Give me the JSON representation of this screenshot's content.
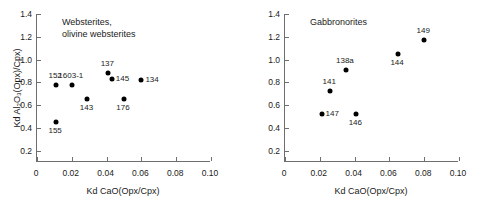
{
  "figure": {
    "axis_color": "#6e6e6e",
    "marker_color": "#000000",
    "background": "#ffffff"
  },
  "chart_data": [
    {
      "type": "scatter",
      "title": "Websterites,\nolivine websterites",
      "xlabel": "Kd CaO(Opx/Cpx)",
      "ylabel": "Kd Al₂O₃(Opx)/Cpx)",
      "xlim": [
        0,
        0.1
      ],
      "ylim": [
        0.1,
        1.4
      ],
      "grid": false,
      "legend": "none",
      "xticks": [
        0,
        0.02,
        0.04,
        0.06,
        0.08,
        0.1
      ],
      "xticklabels": [
        "0",
        "0.02",
        "0.04",
        "0.06",
        "0.08",
        "0.10"
      ],
      "yticks": [
        0.2,
        0.4,
        0.6,
        0.8,
        1.0,
        1.2,
        1.4
      ],
      "yticklabels": [
        "0.2",
        "0.4",
        "0.6",
        "0.8",
        "1.0",
        "1.2",
        "1.4"
      ],
      "points": [
        {
          "label": "152",
          "x": 0.011,
          "y": 0.78,
          "label_pos": "above"
        },
        {
          "label": "1603-1",
          "x": 0.02,
          "y": 0.78,
          "label_pos": "above"
        },
        {
          "label": "155",
          "x": 0.011,
          "y": 0.45,
          "label_pos": "below"
        },
        {
          "label": "143",
          "x": 0.029,
          "y": 0.65,
          "label_pos": "below"
        },
        {
          "label": "137",
          "x": 0.041,
          "y": 0.88,
          "label_pos": "above"
        },
        {
          "label": "145",
          "x": 0.043,
          "y": 0.83,
          "label_pos": "right"
        },
        {
          "label": "176",
          "x": 0.05,
          "y": 0.65,
          "label_pos": "below"
        },
        {
          "label": "134",
          "x": 0.06,
          "y": 0.82,
          "label_pos": "right"
        }
      ]
    },
    {
      "type": "scatter",
      "title": "Gabbronorites",
      "xlabel": "Kd CaO(Opx/Cpx)",
      "ylabel": "",
      "xlim": [
        0,
        0.1
      ],
      "ylim": [
        0.1,
        1.4
      ],
      "grid": false,
      "legend": "none",
      "xticks": [
        0,
        0.02,
        0.04,
        0.06,
        0.08,
        0.1
      ],
      "xticklabels": [
        "0",
        "0.02",
        "0.04",
        "0.06",
        "0.08",
        "0.10"
      ],
      "yticks": [
        0.2,
        0.4,
        0.6,
        0.8,
        1.0,
        1.2,
        1.4
      ],
      "yticklabels": [
        "0.2",
        "0.4",
        "0.6",
        "0.8",
        "1.0",
        "1.2",
        "1.4"
      ],
      "points": [
        {
          "label": "147",
          "x": 0.021,
          "y": 0.525,
          "label_pos": "right"
        },
        {
          "label": "141",
          "x": 0.026,
          "y": 0.72,
          "label_pos": "above"
        },
        {
          "label": "138a",
          "x": 0.035,
          "y": 0.91,
          "label_pos": "above"
        },
        {
          "label": "146",
          "x": 0.041,
          "y": 0.52,
          "label_pos": "below"
        },
        {
          "label": "144",
          "x": 0.065,
          "y": 1.05,
          "label_pos": "below"
        },
        {
          "label": "149",
          "x": 0.08,
          "y": 1.17,
          "label_pos": "above"
        }
      ]
    }
  ]
}
